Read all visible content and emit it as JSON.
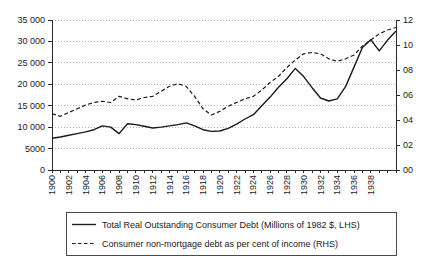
{
  "chart_data": {
    "type": "line",
    "title": "",
    "x": [
      1900,
      1901,
      1902,
      1903,
      1904,
      1905,
      1906,
      1907,
      1908,
      1909,
      1910,
      1911,
      1912,
      1913,
      1914,
      1915,
      1916,
      1917,
      1918,
      1919,
      1920,
      1921,
      1922,
      1923,
      1924,
      1925,
      1926,
      1927,
      1928,
      1929,
      1930,
      1931,
      1932,
      1933,
      1934,
      1935,
      1936,
      1937,
      1938,
      1939,
      1940,
      1941
    ],
    "series": [
      {
        "name": "Total Real Outstanding Consumer Debt (Millions of 1982 $, LHS)",
        "axis": "left",
        "style": "solid",
        "values": [
          7400,
          7700,
          8100,
          8500,
          8900,
          9400,
          10300,
          10000,
          8500,
          10800,
          10600,
          10200,
          9800,
          10000,
          10300,
          10600,
          11000,
          10300,
          9400,
          9000,
          9100,
          9700,
          10700,
          11900,
          12900,
          15000,
          17000,
          19300,
          21300,
          23700,
          21800,
          19200,
          16800,
          16100,
          16600,
          19500,
          24000,
          28600,
          30400,
          27800,
          30300,
          32400
        ]
      },
      {
        "name": "Consumer non-mortgage debt as per cent of income (RHS)",
        "axis": "right",
        "style": "dashed",
        "values": [
          4.5,
          4.3,
          4.6,
          4.9,
          5.2,
          5.4,
          5.5,
          5.4,
          5.9,
          5.7,
          5.6,
          5.8,
          5.9,
          6.3,
          6.7,
          6.9,
          6.7,
          5.9,
          4.9,
          4.4,
          4.7,
          5.1,
          5.4,
          5.7,
          5.9,
          6.4,
          7.0,
          7.5,
          8.2,
          8.8,
          9.3,
          9.4,
          9.3,
          8.9,
          8.7,
          8.9,
          9.2,
          9.9,
          10.4,
          10.9,
          11.2,
          11.4
        ]
      }
    ],
    "left_axis": {
      "min": 0,
      "max": 35000,
      "step": 5000,
      "ticks": [
        "35 000",
        "30 000",
        "25 000",
        "20 000",
        "15 000",
        "10 000",
        "5000",
        "0"
      ]
    },
    "right_axis": {
      "min": 0,
      "max": 12,
      "step": 2,
      "ticks": [
        "12",
        "10",
        "08",
        "06",
        "04",
        "02",
        "00"
      ]
    },
    "x_axis": {
      "min": 1900,
      "max": 1941,
      "tick_every": 1,
      "label_years": [
        1900,
        1902,
        1904,
        1906,
        1908,
        1910,
        1912,
        1914,
        1916,
        1918,
        1920,
        1922,
        1924,
        1926,
        1928,
        1930,
        1932,
        1934,
        1936,
        1938
      ]
    },
    "grid": "horizontal-dotted",
    "legend_position": "bottom",
    "colors": {
      "line": "#1a1a1a",
      "grid": "#b5b5b5",
      "axis": "#2a2a2a"
    }
  }
}
